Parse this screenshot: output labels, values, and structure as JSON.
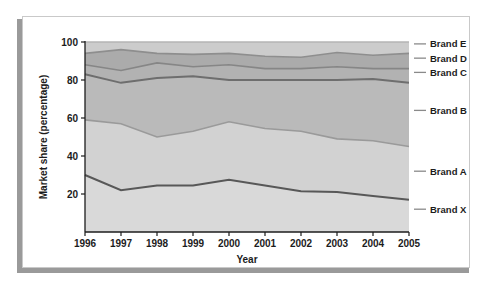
{
  "chart_data": {
    "type": "area",
    "title": "",
    "subtitle": "",
    "xlabel": "Year",
    "ylabel": "Market share (percentage)",
    "categories": [
      "1996",
      "1997",
      "1998",
      "1999",
      "2000",
      "2001",
      "2002",
      "2003",
      "2004",
      "2005"
    ],
    "x": [
      1996,
      1997,
      1998,
      1999,
      2000,
      2001,
      2002,
      2003,
      2004,
      2005
    ],
    "xlim": [
      1996,
      2005
    ],
    "ylim": [
      0,
      100
    ],
    "yticks": [
      "20",
      "40",
      "60",
      "80",
      "100"
    ],
    "ytick_values": [
      20,
      40,
      60,
      80,
      100
    ],
    "grid": false,
    "stacked": true,
    "legend_position": "right",
    "legend": [
      "Brand E",
      "Brand D",
      "Brand C",
      "Brand B",
      "Brand A",
      "Brand X"
    ],
    "cumulative_boundaries": [
      {
        "name": "Brand X top",
        "values": [
          30,
          22,
          24.5,
          24.5,
          27.5,
          24.5,
          21.5,
          21,
          19,
          17
        ]
      },
      {
        "name": "Brand A top",
        "values": [
          59,
          57,
          50,
          53,
          58,
          54.5,
          53,
          49,
          48,
          45
        ]
      },
      {
        "name": "Brand B top",
        "values": [
          83,
          78.5,
          81,
          82,
          80,
          80,
          80,
          80,
          80.5,
          78.5
        ]
      },
      {
        "name": "Brand C top",
        "values": [
          88,
          85,
          89,
          87,
          88,
          86,
          86,
          87,
          86,
          86
        ]
      },
      {
        "name": "Brand D top",
        "values": [
          94,
          96,
          94,
          93.5,
          94,
          92.5,
          92,
          94.5,
          93,
          94
        ]
      },
      {
        "name": "Brand E top",
        "values": [
          100,
          100,
          100,
          100,
          100,
          100,
          100,
          100,
          100,
          100
        ]
      }
    ],
    "series": [
      {
        "name": "Brand X",
        "values": [
          30,
          22,
          24.5,
          24.5,
          27.5,
          24.5,
          21.5,
          21,
          19,
          17
        ],
        "color": "#d8d8d8"
      },
      {
        "name": "Brand A",
        "values": [
          29,
          35,
          25.5,
          28.5,
          30.5,
          30,
          31.5,
          28,
          29,
          28
        ],
        "color": "#d0d0d0"
      },
      {
        "name": "Brand B",
        "values": [
          24,
          21.5,
          31,
          29,
          22,
          25.5,
          27,
          31,
          32.5,
          33.5
        ],
        "color": "#b8b8b8"
      },
      {
        "name": "Brand C",
        "values": [
          5,
          6.5,
          8,
          5,
          8,
          6,
          6,
          7,
          5.5,
          7.5
        ],
        "color": "#b0b0b0"
      },
      {
        "name": "Brand D",
        "values": [
          6,
          11,
          5,
          6.5,
          6,
          6.5,
          6,
          7.5,
          6.5,
          8
        ],
        "color": "#a8a8a8"
      },
      {
        "name": "Brand E",
        "values": [
          6,
          4,
          6,
          6.5,
          6,
          7.5,
          8,
          5.5,
          7,
          6
        ],
        "color": "#cfcfcf"
      }
    ],
    "line_colors": {
      "brand_x": "#585858",
      "brand_a": "#9a9a9a",
      "brand_b": "#6e6e6e",
      "brand_c": "#868686",
      "brand_d": "#8e8e8e",
      "brand_e": "#b5b5b5"
    },
    "band_colors": {
      "brand_x": "#d9d9d9",
      "brand_a": "#d2d2d2",
      "brand_b": "#bababa",
      "brand_c": "#b2b2b2",
      "brand_d": "#ababab",
      "brand_e": "#cccccc"
    },
    "axis_color": "#1c1c1c",
    "background": "#ffffff"
  },
  "legend_items": [
    {
      "label": "Brand E",
      "y_value": 99.0
    },
    {
      "label": "Brand D",
      "y_value": 91.5
    },
    {
      "label": "Brand C",
      "y_value": 84.0
    },
    {
      "label": "Brand B",
      "y_value": 64.0
    },
    {
      "label": "Brand A",
      "y_value": 32.0
    },
    {
      "label": "Brand X",
      "y_value": 12.0
    }
  ]
}
